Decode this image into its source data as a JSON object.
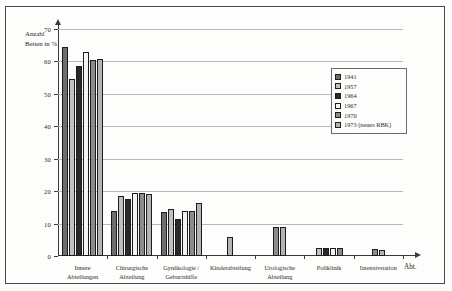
{
  "chart_data": {
    "type": "bar",
    "title": "",
    "xlabel": "Abt.",
    "ylabel": "Anzahl Betten in %",
    "ylim": [
      0,
      70
    ],
    "yticks": [
      0,
      10,
      20,
      30,
      40,
      50,
      60,
      70
    ],
    "grid": true,
    "legend_position": "upper-right",
    "categories": [
      "Innere Abteilungen",
      "Chirurgische Abteilung",
      "Gynäkologie / Geburtshilfe",
      "Kinderabteilung",
      "Urologische Abteilung",
      "Poliklinik",
      "Intensivstation"
    ],
    "series": [
      {
        "name": "1941",
        "color": "#6e6e6e",
        "values": [
          64.5,
          14.0,
          13.5,
          null,
          null,
          null,
          null
        ]
      },
      {
        "name": "1957",
        "color": "#c0c0c0",
        "values": [
          54.5,
          18.5,
          14.5,
          null,
          null,
          2.5,
          null
        ]
      },
      {
        "name": "1964",
        "color": "#2a2a2a",
        "values": [
          58.5,
          17.5,
          11.5,
          null,
          null,
          2.5,
          null
        ]
      },
      {
        "name": "1967",
        "color": "#f4f4f0",
        "values": [
          63.0,
          19.5,
          14.0,
          null,
          null,
          2.5,
          null
        ]
      },
      {
        "name": "1970",
        "color": "#8c8c8c",
        "values": [
          60.5,
          19.5,
          14.0,
          null,
          9.0,
          2.5,
          2.3
        ]
      },
      {
        "name": "1973 (neues RBK)",
        "color": "#b4b4b4",
        "values": [
          60.8,
          19.0,
          16.5,
          6.0,
          9.0,
          null,
          2.0
        ]
      }
    ]
  },
  "legend": {
    "entries": [
      {
        "label": "1941"
      },
      {
        "label": "1957"
      },
      {
        "label": "1964"
      },
      {
        "label": "1967"
      },
      {
        "label": "1970"
      },
      {
        "label": "1973 (neues RBK)"
      }
    ]
  },
  "axes": {
    "y_label_line1": "Anzahl",
    "y_label_line2": "Betten in %",
    "x_axis_end_label": "Abt.",
    "y_tick_labels": [
      "0",
      "10",
      "20",
      "30",
      "40",
      "50",
      "60",
      "70"
    ]
  }
}
